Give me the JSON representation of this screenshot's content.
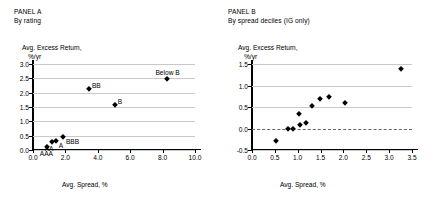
{
  "chart_data": [
    {
      "type": "scatter",
      "panel": "PANEL A",
      "subtitle": "By rating",
      "title": "",
      "xlabel": "Avg. Spread, %",
      "ylabel_line1": "Avg. Excess Return,",
      "ylabel_line2": "%/yr",
      "xlim": [
        0.0,
        10.0
      ],
      "ylim": [
        0.0,
        3.0
      ],
      "xticks": [
        "0.0",
        "2.0",
        "4.0",
        "6.0",
        "8.0",
        "10.0"
      ],
      "xtick_values": [
        0.0,
        2.0,
        4.0,
        6.0,
        8.0,
        10.0
      ],
      "yticks": [
        "0.0",
        "0.5",
        "1.0",
        "1.5",
        "2.0",
        "2.5",
        "3.0"
      ],
      "ytick_values": [
        0.0,
        0.5,
        1.0,
        1.5,
        2.0,
        2.5,
        3.0
      ],
      "grid": true,
      "legend": "none",
      "marker": "filled-diamond",
      "marker_color": "#000000",
      "points": [
        {
          "label": "AAA",
          "x": 0.85,
          "y": 0.09,
          "label_pos": "below"
        },
        {
          "label": "AA",
          "x": 1.15,
          "y": 0.27,
          "label_pos": "below"
        },
        {
          "label": "A",
          "x": 1.4,
          "y": 0.3,
          "label_pos": "right"
        },
        {
          "label": "BBB",
          "x": 1.85,
          "y": 0.46,
          "label_pos": "right"
        },
        {
          "label": "BB",
          "x": 3.45,
          "y": 2.12,
          "label_pos": "right-up"
        },
        {
          "label": "B",
          "x": 5.05,
          "y": 1.57,
          "label_pos": "right-up"
        },
        {
          "label": "Below B",
          "x": 8.3,
          "y": 2.47,
          "label_pos": "above"
        }
      ]
    },
    {
      "type": "scatter",
      "panel": "PANEL B",
      "subtitle": "By spread deciles (IG only)",
      "title": "",
      "xlabel": "Avg. Spread, %",
      "ylabel_line1": "Avg. Excess Return,",
      "ylabel_line2": "%/yr",
      "xlim": [
        0.0,
        3.5
      ],
      "ylim": [
        -0.5,
        1.5
      ],
      "xticks": [
        "0.0",
        "0.5",
        "1.0",
        "1.5",
        "2.0",
        "2.5",
        "3.0",
        "3.5"
      ],
      "xtick_values": [
        0.0,
        0.5,
        1.0,
        1.5,
        2.0,
        2.5,
        3.0,
        3.5
      ],
      "yticks": [
        "-0.5",
        "0.0",
        "0.5",
        "1.0",
        "1.5"
      ],
      "ytick_values": [
        -0.5,
        0.0,
        0.5,
        1.0,
        1.5
      ],
      "grid": true,
      "zero_line": true,
      "legend": "none",
      "marker": "filled-diamond",
      "marker_color": "#000000",
      "points": [
        {
          "label": "",
          "x": 0.53,
          "y": -0.28
        },
        {
          "label": "",
          "x": 0.78,
          "y": 0.0
        },
        {
          "label": "",
          "x": 0.9,
          "y": 0.0
        },
        {
          "label": "",
          "x": 1.02,
          "y": 0.33
        },
        {
          "label": "",
          "x": 1.05,
          "y": 0.08
        },
        {
          "label": "",
          "x": 1.18,
          "y": 0.13
        },
        {
          "label": "",
          "x": 1.32,
          "y": 0.52
        },
        {
          "label": "",
          "x": 1.48,
          "y": 0.69
        },
        {
          "label": "",
          "x": 1.68,
          "y": 0.73
        },
        {
          "label": "",
          "x": 2.03,
          "y": 0.6
        },
        {
          "label": "",
          "x": 3.25,
          "y": 1.38
        }
      ]
    }
  ]
}
